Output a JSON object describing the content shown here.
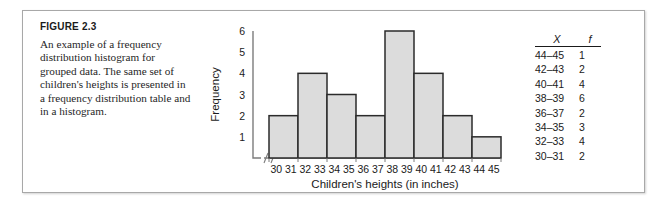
{
  "figure": {
    "title": "FIGURE 2.3",
    "caption": "An example of a frequency distribution histogram for grouped data. The same set of children's heights is presented in a frequency distribution table and in a histogram."
  },
  "table": {
    "header_x": "X",
    "header_f": "f",
    "rows": [
      {
        "interval": "44–45",
        "frequency": "1"
      },
      {
        "interval": "42–43",
        "frequency": "2"
      },
      {
        "interval": "40–41",
        "frequency": "4"
      },
      {
        "interval": "38–39",
        "frequency": "6"
      },
      {
        "interval": "36–37",
        "frequency": "2"
      },
      {
        "interval": "34–35",
        "frequency": "3"
      },
      {
        "interval": "32–33",
        "frequency": "4"
      },
      {
        "interval": "30–31",
        "frequency": "2"
      }
    ]
  },
  "chart_data": {
    "type": "bar",
    "title": "",
    "xlabel": "Children's heights (in inches)",
    "ylabel": "Frequency",
    "categories": [
      "30–31",
      "32–33",
      "34–35",
      "36–37",
      "38–39",
      "40–41",
      "42–43",
      "44–45"
    ],
    "values": [
      2,
      4,
      3,
      2,
      6,
      4,
      2,
      1
    ],
    "x_tick_labels": [
      "30",
      "31",
      "32",
      "33",
      "34",
      "35",
      "36",
      "37",
      "38",
      "39",
      "40",
      "41",
      "42",
      "43",
      "44",
      "45"
    ],
    "y_tick_labels": [
      "1",
      "2",
      "3",
      "4",
      "5",
      "6"
    ],
    "ylim": [
      0,
      6
    ],
    "grid": false,
    "legend": false,
    "axis_break": true,
    "bar_fill": "#dcdcdc",
    "bar_stroke": "#2b2b2b",
    "axis_color": "#7c7c7c"
  }
}
